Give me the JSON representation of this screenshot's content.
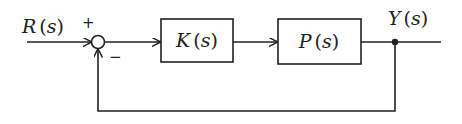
{
  "diagram": {
    "type": "feedback-control-block-diagram",
    "input_signal": {
      "name": "R",
      "arg": "s"
    },
    "output_signal": {
      "name": "Y",
      "arg": "s"
    },
    "summing_junction": {
      "plus_sign": "+",
      "minus_sign": "−"
    },
    "blocks": [
      {
        "id": "controller",
        "name": "K",
        "arg": "s"
      },
      {
        "id": "plant",
        "name": "P",
        "arg": "s"
      }
    ],
    "feedback": "unity negative feedback from Y(s) to summing junction",
    "colors": {
      "line": "#222222",
      "background": "#ffffff"
    }
  }
}
